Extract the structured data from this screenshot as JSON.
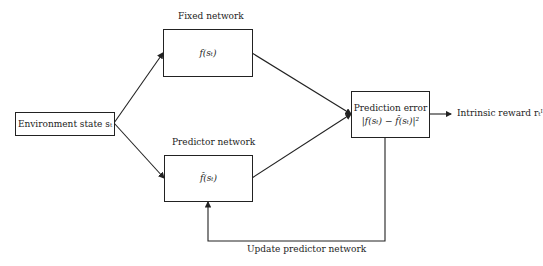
{
  "nodes": {
    "environment": {
      "text": "Environment state sₜ"
    },
    "fixed": {
      "title": "Fixed network",
      "text": "f(sₜ)"
    },
    "predictor": {
      "title": "Predictor network",
      "text": "f̂(sₜ)"
    },
    "error": {
      "line1": "Prediction error",
      "line2": "|f(sₜ) − f̂(sₜ)|²"
    }
  },
  "edges": {
    "output_label": "Intrinsic reward rₜᴵ",
    "feedback_label": "Update predictor network"
  }
}
